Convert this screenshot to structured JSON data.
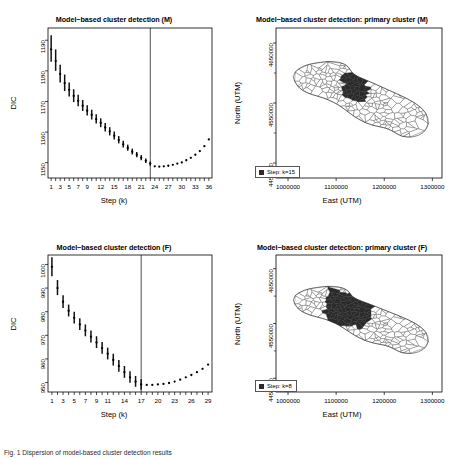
{
  "figure": {
    "caption": "Fig. 1  Dispersion of model-based cluster detection results",
    "panels": [
      "dic-male",
      "map-male",
      "dic-female",
      "map-female"
    ]
  },
  "chart_data": [
    {
      "id": "dic-male",
      "type": "scatter",
      "title": "Model−based cluster detection (M)",
      "xlabel": "Step (k)",
      "ylabel": "DIC",
      "xlim": [
        0.3,
        36.7
      ],
      "ylim": [
        1145.0,
        1194.0
      ],
      "xticks": [
        1,
        3,
        5,
        7,
        9,
        12,
        15,
        18,
        21,
        24,
        27,
        30,
        33,
        36
      ],
      "xtick_labels": [
        "1",
        "3",
        "5",
        "7",
        "9",
        "12",
        "15",
        "18",
        "21",
        "24",
        "27",
        "30",
        "33",
        "36"
      ],
      "yticks": [
        1150,
        1160,
        1170,
        1180,
        1190
      ],
      "ytick_labels": [
        "1150",
        "1160",
        "1170",
        "1180",
        "1190"
      ],
      "grid": false,
      "vline_x": 23,
      "vline_label": "selected step k=23",
      "x": [
        1,
        2,
        3,
        4,
        5,
        6,
        7,
        8,
        9,
        10,
        11,
        12,
        13,
        14,
        15,
        16,
        17,
        18,
        19,
        20,
        21,
        22,
        23,
        24,
        25,
        26,
        27,
        28,
        29,
        30,
        31,
        32,
        33,
        34,
        35,
        36
      ],
      "values": [
        1187.0,
        1183.2,
        1179.0,
        1176.0,
        1173.8,
        1171.8,
        1170.2,
        1168.6,
        1167.0,
        1165.6,
        1164.2,
        1163.0,
        1161.5,
        1160.2,
        1158.8,
        1157.4,
        1156.0,
        1154.8,
        1153.6,
        1152.6,
        1151.6,
        1150.6,
        1149.7,
        1148.8,
        1148.7,
        1148.8,
        1149.0,
        1149.3,
        1149.7,
        1150.1,
        1150.8,
        1151.6,
        1152.6,
        1153.8,
        1155.4,
        1157.6
      ],
      "err_low": [
        1183.0,
        1180.0,
        1176.2,
        1173.4,
        1171.6,
        1169.8,
        1168.4,
        1166.9,
        1165.4,
        1164.1,
        1162.8,
        1161.6,
        1160.2,
        1158.9,
        1157.6,
        1156.3,
        1155.0,
        1153.9,
        1152.7,
        1151.8,
        1150.8,
        1149.9,
        1149.0,
        null,
        null,
        null,
        null,
        null,
        null,
        null,
        null,
        null,
        null,
        null,
        null,
        null
      ],
      "err_high": [
        1191.6,
        1187.0,
        1182.0,
        1178.8,
        1176.2,
        1174.0,
        1172.2,
        1170.5,
        1168.8,
        1167.3,
        1165.8,
        1164.5,
        1163.0,
        1161.6,
        1160.2,
        1158.7,
        1157.2,
        1155.9,
        1154.6,
        1153.5,
        1152.5,
        1151.4,
        1150.4,
        null,
        null,
        null,
        null,
        null,
        null,
        null,
        null,
        null,
        null,
        null,
        null,
        null
      ]
    },
    {
      "id": "dic-female",
      "type": "scatter",
      "title": "Model−based cluster detection (F)",
      "xlabel": "Step (k)",
      "ylabel": "DIC",
      "xlim": [
        0.3,
        29.7
      ],
      "ylim": [
        946.0,
        1004.0
      ],
      "xticks": [
        1,
        3,
        5,
        7,
        9,
        11,
        14,
        17,
        20,
        23,
        26,
        29
      ],
      "xtick_labels": [
        "1",
        "3",
        "5",
        "7",
        "9",
        "11",
        "14",
        "17",
        "20",
        "23",
        "26",
        "29"
      ],
      "yticks": [
        950,
        960,
        970,
        980,
        990,
        1000
      ],
      "ytick_labels": [
        "950",
        "960",
        "970",
        "980",
        "990",
        "1000"
      ],
      "grid": false,
      "vline_x": 17,
      "vline_label": "selected step k=17",
      "x": [
        1,
        2,
        3,
        4,
        5,
        6,
        7,
        8,
        9,
        10,
        11,
        12,
        13,
        14,
        15,
        16,
        17,
        18,
        19,
        20,
        21,
        22,
        23,
        24,
        25,
        26,
        27,
        28,
        29
      ],
      "values": [
        999.0,
        990.0,
        984.2,
        980.4,
        977.4,
        974.6,
        972.0,
        969.4,
        967.0,
        964.6,
        962.2,
        959.6,
        957.0,
        954.4,
        952.2,
        950.4,
        949.2,
        949.0,
        949.0,
        949.2,
        949.4,
        949.8,
        950.4,
        951.2,
        952.2,
        953.2,
        954.4,
        955.8,
        957.6
      ],
      "err_low": [
        995.0,
        987.0,
        981.6,
        978.0,
        975.0,
        972.2,
        969.6,
        967.0,
        964.6,
        962.2,
        959.8,
        957.2,
        954.6,
        952.0,
        949.9,
        948.2,
        947.0,
        null,
        null,
        null,
        null,
        null,
        null,
        null,
        null,
        null,
        null,
        null,
        null
      ],
      "err_high": [
        1003.0,
        993.4,
        987.0,
        983.0,
        980.0,
        977.2,
        974.6,
        972.0,
        969.6,
        967.2,
        964.8,
        962.2,
        959.6,
        957.0,
        954.8,
        952.8,
        951.4,
        null,
        null,
        null,
        null,
        null,
        null,
        null,
        null,
        null,
        null,
        null,
        null
      ]
    },
    {
      "id": "map-male",
      "type": "map",
      "title": "Model−based cluster detection: primary cluster (M)",
      "xlabel": "East (UTM)",
      "ylabel": "North (UTM)",
      "xlim": [
        975000,
        1320000
      ],
      "ylim": [
        4425000,
        4675000
      ],
      "xticks": [
        1000000,
        1100000,
        1200000,
        1300000
      ],
      "xtick_labels": [
        "1000000",
        "1100000",
        "1200000",
        "1300000"
      ],
      "yticks": [
        4450000,
        4550000,
        4650000
      ],
      "ytick_labels": [
        "4450000",
        "4550000",
        "4650000"
      ],
      "grid": false,
      "legend": {
        "swatch_color": "#2b2b2b",
        "label": "Step: k=15"
      },
      "region": "Puglia, Italy — municipality polygons",
      "cluster_fill": "#2b2b2b",
      "polygon_stroke": "#333333"
    },
    {
      "id": "map-female",
      "type": "map",
      "title": "Model−based cluster detection: primary cluster (F)",
      "xlabel": "East (UTM)",
      "ylabel": "North (UTM)",
      "xlim": [
        975000,
        1320000
      ],
      "ylim": [
        4425000,
        4675000
      ],
      "xticks": [
        1000000,
        1100000,
        1200000,
        1300000
      ],
      "xtick_labels": [
        "1000000",
        "1100000",
        "1200000",
        "1300000"
      ],
      "yticks": [
        4450000,
        4550000,
        4650000
      ],
      "ytick_labels": [
        "4450000",
        "4550000",
        "4650000"
      ],
      "grid": false,
      "legend": {
        "swatch_color": "#2b2b2b",
        "label": "Step: k=8"
      },
      "region": "Puglia, Italy — municipality polygons",
      "cluster_fill": "#2b2b2b",
      "polygon_stroke": "#333333"
    }
  ]
}
